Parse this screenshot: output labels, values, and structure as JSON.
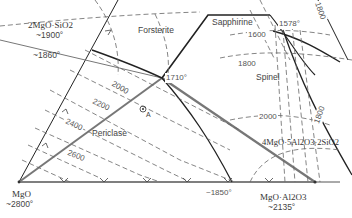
{
  "diagram": {
    "title": "",
    "compounds": {
      "forsterite_comp": {
        "formula": "2MgO·SiO2",
        "temp": "~1900°"
      },
      "periclase_comp": {
        "formula": "MgO",
        "temp": "~2800°"
      },
      "spinel_comp": {
        "formula": "MgO·Al2O3",
        "temp": "~2135°"
      },
      "cordierite_comp": {
        "formula": "4MgO·5Al2O3·2SiO2"
      }
    },
    "fields": {
      "forsterite": "Forsterite",
      "sapphirine": "Sapphirine",
      "spinel": "Spinel",
      "periclase": "Periclase"
    },
    "points": {
      "eutectic_left": "~1860°",
      "invariant_center": "1710°",
      "invariant_top": "1578°",
      "binary_bottom": "~1850°",
      "composition_A": "A"
    },
    "isotherms": [
      "1600",
      "1800",
      "1800",
      "2000",
      "2000",
      "2200",
      "2400",
      "2600",
      "1800"
    ],
    "colors": {
      "boundary": "#222222",
      "isotherm": "#666666",
      "tie_line": "#777777"
    }
  }
}
